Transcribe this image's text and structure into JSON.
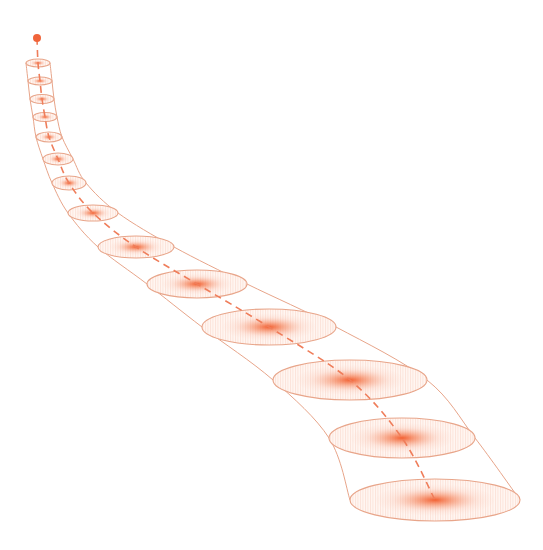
{
  "colors": {
    "background": "#ffffff",
    "accent": "#f0643a",
    "outline": "#e8a58a",
    "core": "#f26a3c"
  },
  "diagram": {
    "type": "diffusion-tube",
    "start_point": {
      "x": 37,
      "y": 38,
      "r": 4
    },
    "sections": [
      {
        "cx": 38,
        "cy": 63,
        "rx": 12,
        "ry": 4
      },
      {
        "cx": 40,
        "cy": 81,
        "rx": 12,
        "ry": 4
      },
      {
        "cx": 42,
        "cy": 99,
        "rx": 12,
        "ry": 4.5
      },
      {
        "cx": 45,
        "cy": 117,
        "rx": 12,
        "ry": 4.5
      },
      {
        "cx": 49,
        "cy": 137,
        "rx": 13,
        "ry": 5
      },
      {
        "cx": 58,
        "cy": 159,
        "rx": 15,
        "ry": 6
      },
      {
        "cx": 69,
        "cy": 183,
        "rx": 17,
        "ry": 7
      },
      {
        "cx": 93,
        "cy": 213,
        "rx": 25,
        "ry": 8
      },
      {
        "cx": 136,
        "cy": 247,
        "rx": 38,
        "ry": 11
      },
      {
        "cx": 197,
        "cy": 284,
        "rx": 50,
        "ry": 14
      },
      {
        "cx": 269,
        "cy": 327,
        "rx": 67,
        "ry": 18
      },
      {
        "cx": 350,
        "cy": 380,
        "rx": 77,
        "ry": 20
      },
      {
        "cx": 402,
        "cy": 438,
        "rx": 73,
        "ry": 20
      },
      {
        "cx": 435,
        "cy": 500,
        "rx": 85,
        "ry": 21
      }
    ]
  }
}
